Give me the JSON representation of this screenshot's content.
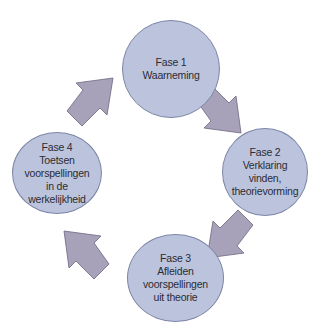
{
  "diagram": {
    "type": "cycle",
    "colors": {
      "phase_fill": "#bcc4dd",
      "phase_border": "#7d86a6",
      "arrow_fill": "#a7a1b9",
      "arrow_border": "#6c6680",
      "text": "#2b2b33"
    },
    "phases": [
      {
        "title": "Fase 1",
        "lines": [
          "Waarneming"
        ]
      },
      {
        "title": "Fase 2",
        "lines": [
          "Verklaring",
          "vinden,",
          "theorievorming"
        ]
      },
      {
        "title": "Fase 3",
        "lines": [
          "Afleiden",
          "voorspellingen",
          "uit theorie"
        ]
      },
      {
        "title": "Fase 4",
        "lines": [
          "Toetsen",
          "voorspellingen",
          "in de",
          "werkelijkheid"
        ]
      }
    ],
    "arrows": [
      {
        "from": "Fase 1",
        "to": "Fase 2"
      },
      {
        "from": "Fase 2",
        "to": "Fase 3"
      },
      {
        "from": "Fase 3",
        "to": "Fase 4"
      },
      {
        "from": "Fase 4",
        "to": "Fase 1"
      }
    ]
  }
}
